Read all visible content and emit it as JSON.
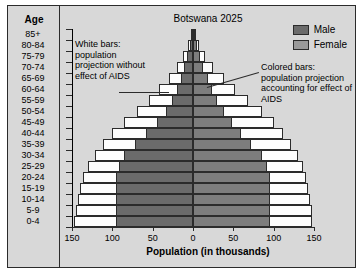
{
  "chart_data": {
    "type": "bar",
    "subtype": "population-pyramid",
    "title": "Botswana 2025",
    "xlabel": "Population (in thousands)",
    "ylabel": "Age",
    "xlim": [
      -150,
      150
    ],
    "xticks": [
      150,
      100,
      50,
      0,
      50,
      100,
      150
    ],
    "grid": false,
    "legend_position": "top-right",
    "categories": [
      "85+",
      "80-84",
      "75-79",
      "70-74",
      "65-69",
      "60-64",
      "55-59",
      "50-54",
      "45-49",
      "40-44",
      "35-39",
      "30-34",
      "25-29",
      "20-24",
      "15-19",
      "10-14",
      "5-9",
      "0-4"
    ],
    "series": [
      {
        "name": "Male",
        "side": "left",
        "style": "colored",
        "values": [
          2,
          4,
          7,
          11,
          15,
          20,
          26,
          34,
          45,
          58,
          72,
          85,
          92,
          95,
          95,
          95,
          95,
          95
        ]
      },
      {
        "name": "Male (without AIDS)",
        "side": "left",
        "style": "white",
        "values": [
          3,
          6,
          12,
          20,
          30,
          42,
          55,
          70,
          85,
          100,
          112,
          122,
          130,
          136,
          140,
          143,
          145,
          147
        ]
      },
      {
        "name": "Female",
        "side": "right",
        "style": "colored",
        "values": [
          3,
          5,
          9,
          13,
          18,
          24,
          30,
          38,
          48,
          60,
          72,
          85,
          92,
          95,
          95,
          95,
          95,
          95
        ]
      },
      {
        "name": "Female (without AIDS)",
        "side": "right",
        "style": "white",
        "values": [
          4,
          8,
          15,
          25,
          38,
          52,
          68,
          85,
          100,
          112,
          122,
          130,
          136,
          140,
          143,
          145,
          147,
          148
        ]
      }
    ],
    "annotations": [
      {
        "id": "left",
        "text": "White bars: population projection without effect of AIDS"
      },
      {
        "id": "right",
        "text": "Colored bars: population projection accounting for effect of AIDS"
      }
    ]
  },
  "axis": {
    "age_header": "Age",
    "x_title": "Population (in thousands)",
    "x_tick_labels": [
      "150",
      "100",
      "50",
      "0",
      "50",
      "100",
      "150"
    ]
  },
  "legend": {
    "items": [
      {
        "label": "Male",
        "color": "#6b6b6b"
      },
      {
        "label": "Female",
        "color": "#9a9a9a"
      }
    ]
  },
  "colors": {
    "background": "#d8d8d8",
    "border": "#2b2b2b",
    "white_bar": "#fdfdfd",
    "male_bar": "#6b6b6b",
    "female_bar": "#7d7d7d"
  }
}
